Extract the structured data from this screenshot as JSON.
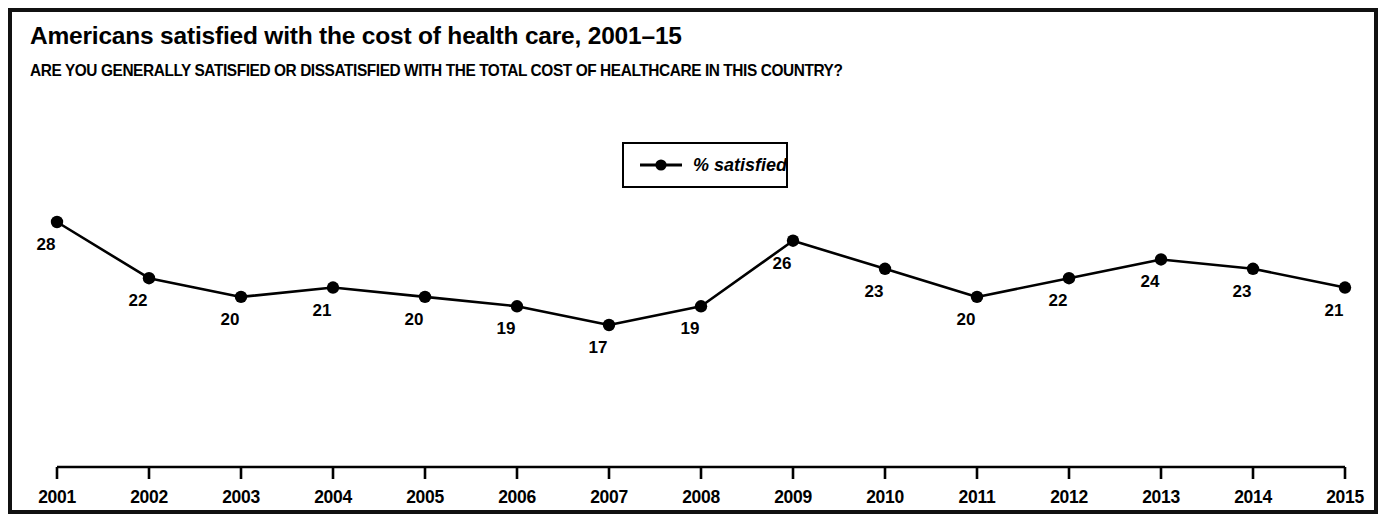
{
  "chart_title": "Americans satisfied with the cost of health care, 2001–15",
  "chart_subtitle": "ARE YOU GENERALLY SATISFIED OR DISSATISFIED WITH THE TOTAL COST OF HEALTHCARE IN THIS COUNTRY?",
  "legend": {
    "label": "% satisfied",
    "symbol": "line-with-dot-marker"
  },
  "colors": {
    "line": "#000000",
    "marker": "#000000",
    "text": "#000000",
    "border": "#111111",
    "background": "#ffffff"
  },
  "chart_data": {
    "type": "line",
    "title": "Americans satisfied with the cost of health care, 2001–15",
    "subtitle": "ARE YOU GENERALLY SATISFIED OR DISSATISFIED WITH THE TOTAL COST OF HEALTHCARE IN THIS COUNTRY?",
    "xlabel": "",
    "ylabel": "",
    "categories": [
      "2001",
      "2002",
      "2003",
      "2004",
      "2005",
      "2006",
      "2007",
      "2008",
      "2009",
      "2010",
      "2011",
      "2012",
      "2013",
      "2014",
      "2015"
    ],
    "series": [
      {
        "name": "% satisfied",
        "values": [
          28,
          22,
          20,
          21,
          20,
          19,
          17,
          19,
          26,
          23,
          20,
          22,
          24,
          23,
          21
        ]
      }
    ],
    "point_labels": [
      "28",
      "22",
      "20",
      "21",
      "20",
      "19",
      "17",
      "19",
      "26",
      "23",
      "20",
      "22",
      "24",
      "23",
      "21"
    ],
    "ylim": [
      0,
      32
    ],
    "grid": false,
    "legend_position": "top-center",
    "marker": "circle",
    "axis": {
      "x_ticks": [
        "2001",
        "2002",
        "2003",
        "2004",
        "2005",
        "2006",
        "2007",
        "2008",
        "2009",
        "2010",
        "2011",
        "2012",
        "2013",
        "2014",
        "2015"
      ],
      "x_tick_direction": "down",
      "y_axis_visible": false
    }
  }
}
